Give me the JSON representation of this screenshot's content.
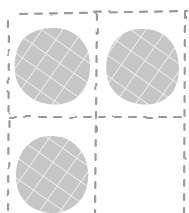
{
  "diagram": {
    "type": "grid-of-cookies",
    "grid": {
      "rows": 2,
      "cols": 2,
      "line_color": "#9a9a9a",
      "line_style": "dashed"
    },
    "cells": [
      {
        "row": 0,
        "col": 0,
        "content": "crosshatched-circle"
      },
      {
        "row": 0,
        "col": 1,
        "content": "crosshatched-circle"
      },
      {
        "row": 1,
        "col": 0,
        "content": "crosshatched-circle"
      },
      {
        "row": 1,
        "col": 1,
        "content": "empty"
      }
    ],
    "circle": {
      "fill": "#c6c6c6",
      "hatch_color": "#ececec"
    }
  }
}
